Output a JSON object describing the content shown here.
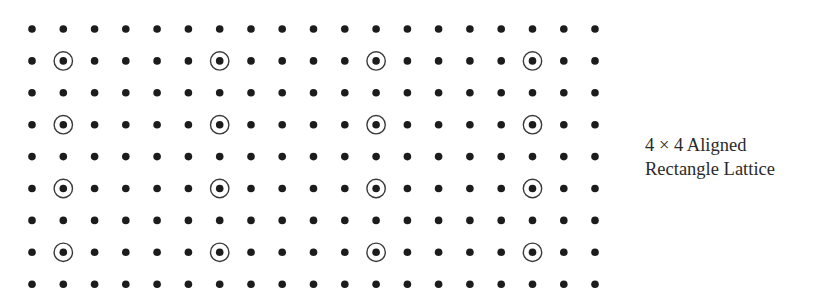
{
  "figure": {
    "type": "lattice-diagram",
    "grid": {
      "columns": 19,
      "rows": 9,
      "origin_x": 32,
      "origin_y": 29,
      "spacing_x": 31.28,
      "spacing_y": 31.9,
      "dot_radius": 3.8,
      "dot_color": "#1c1c1c"
    },
    "highlight": {
      "pattern": "4x4 aligned rectangle lattice",
      "column_indices": [
        1,
        6,
        11,
        16
      ],
      "row_indices": [
        1,
        3,
        5,
        7
      ],
      "ring_radius": 9.2,
      "ring_stroke_width": 1.4,
      "ring_color": "#3a3a3a"
    }
  },
  "caption": {
    "line1": "4 × 4 Aligned",
    "line2": "Rectangle Lattice"
  }
}
